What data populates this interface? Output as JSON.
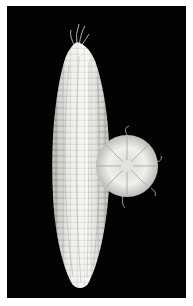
{
  "image": {
    "subject": "white corn ear with cross-section slice",
    "background_color": "#030303",
    "border_color": "#ffffff",
    "kernel_color": "#e8e8e4"
  }
}
